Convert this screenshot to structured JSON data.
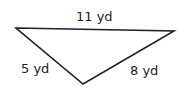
{
  "diagram": {
    "shape": "triangle",
    "vertices": {
      "left": [
        16,
        28
      ],
      "right": [
        174,
        31
      ],
      "bottom": [
        83,
        84
      ]
    },
    "stroke_color": "#222222",
    "sides": {
      "top": {
        "label": "11 yd",
        "length": 11,
        "unit": "yd"
      },
      "left": {
        "label": "5 yd",
        "length": 5,
        "unit": "yd"
      },
      "right": {
        "label": "8 yd",
        "length": 8,
        "unit": "yd"
      }
    }
  }
}
